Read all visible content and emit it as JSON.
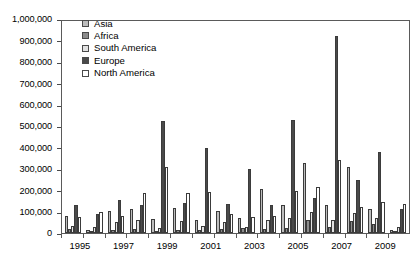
{
  "chart_data": {
    "type": "bar",
    "title": "",
    "subtitle": "",
    "xlabel": "",
    "ylabel": "",
    "ylim": [
      0,
      1000000
    ],
    "grid": false,
    "legend_position": "top-left",
    "y_ticks": [
      "1,000,000",
      "900,000",
      "800,000",
      "700,000",
      "600,000",
      "500,000",
      "400,000",
      "300,000",
      "200,000",
      "100,000",
      "0"
    ],
    "y_tick_values": [
      1000000,
      900000,
      800000,
      700000,
      600000,
      500000,
      400000,
      300000,
      200000,
      100000,
      0
    ],
    "categories": [
      "1995",
      "1996",
      "1997",
      "1998",
      "1999",
      "2000",
      "2001",
      "2002",
      "2003",
      "2004",
      "2005",
      "2006",
      "2007",
      "2008",
      "2009",
      "2010"
    ],
    "x_tick_labels": [
      "1995",
      "",
      "1997",
      "",
      "1999",
      "",
      "2001",
      "",
      "2003",
      "",
      "2005",
      "",
      "2007",
      "",
      "2009",
      ""
    ],
    "series": [
      {
        "name": "Asia",
        "color": "#bdbdbd",
        "values": [
          80000,
          15000,
          105000,
          110000,
          65000,
          115000,
          60000,
          105000,
          70000,
          205000,
          130000,
          325000,
          130000,
          310000,
          110000,
          15000
        ]
      },
      {
        "name": "Africa",
        "color": "#8c8c8c",
        "values": [
          20000,
          8000,
          15000,
          20000,
          10000,
          15000,
          12000,
          20000,
          25000,
          20000,
          25000,
          60000,
          30000,
          55000,
          40000,
          8000
        ]
      },
      {
        "name": "South America",
        "color": "#e2e2e2",
        "values": [
          35000,
          30000,
          50000,
          60000,
          25000,
          55000,
          35000,
          50000,
          30000,
          60000,
          70000,
          100000,
          60000,
          95000,
          70000,
          30000
        ]
      },
      {
        "name": "Europe",
        "color": "#4a4a4a",
        "values": [
          130000,
          90000,
          155000,
          130000,
          525000,
          140000,
          395000,
          135000,
          300000,
          130000,
          530000,
          165000,
          920000,
          250000,
          380000,
          110000
        ]
      },
      {
        "name": "North America",
        "color": "#ffffff",
        "values": [
          75000,
          100000,
          80000,
          185000,
          310000,
          185000,
          190000,
          90000,
          75000,
          80000,
          195000,
          215000,
          340000,
          120000,
          145000,
          135000
        ]
      }
    ]
  },
  "legend": {
    "items": [
      {
        "label": "Asia"
      },
      {
        "label": "Africa"
      },
      {
        "label": "South America"
      },
      {
        "label": "Europe"
      },
      {
        "label": "North America"
      }
    ]
  }
}
